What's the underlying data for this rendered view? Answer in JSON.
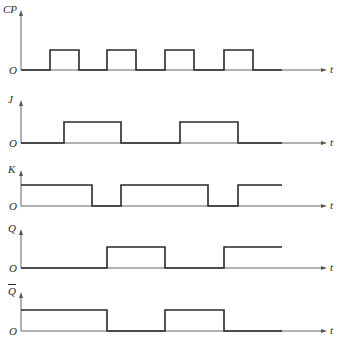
{
  "diagram": {
    "type": "timing-diagram",
    "time_axis_label": "t",
    "origin_label": "O",
    "colors": {
      "signal": "#2a2a2a",
      "axis": "#555555",
      "background": "#ffffff"
    },
    "edges_x": [
      21,
      50,
      64,
      79,
      92,
      107,
      121,
      136,
      165,
      180,
      194,
      208,
      224,
      238,
      253,
      282
    ],
    "signals": [
      {
        "name": "CP",
        "label": "CP",
        "base_y": 70,
        "high_y": 50,
        "label_y": 4,
        "levels": [
          [
            21,
            0
          ],
          [
            50,
            1
          ],
          [
            79,
            0
          ],
          [
            107,
            1
          ],
          [
            136,
            0
          ],
          [
            165,
            1
          ],
          [
            194,
            0
          ],
          [
            224,
            1
          ],
          [
            253,
            0
          ],
          [
            282,
            0
          ]
        ]
      },
      {
        "name": "J",
        "label": "J",
        "base_y": 143,
        "high_y": 122,
        "label_y": 94,
        "levels": [
          [
            21,
            0
          ],
          [
            64,
            1
          ],
          [
            121,
            0
          ],
          [
            180,
            1
          ],
          [
            238,
            0
          ],
          [
            282,
            0
          ]
        ]
      },
      {
        "name": "K",
        "label": "K",
        "base_y": 206,
        "high_y": 185,
        "label_y": 164,
        "levels": [
          [
            21,
            1
          ],
          [
            92,
            0
          ],
          [
            121,
            1
          ],
          [
            208,
            0
          ],
          [
            238,
            1
          ],
          [
            282,
            1
          ]
        ]
      },
      {
        "name": "Q",
        "label": "Q",
        "base_y": 268,
        "high_y": 247,
        "label_y": 223,
        "levels": [
          [
            21,
            0
          ],
          [
            107,
            1
          ],
          [
            165,
            0
          ],
          [
            224,
            1
          ],
          [
            282,
            1
          ]
        ]
      },
      {
        "name": "Qbar",
        "label": "Q",
        "overbar": true,
        "base_y": 331,
        "high_y": 310,
        "label_y": 286,
        "levels": [
          [
            21,
            1
          ],
          [
            107,
            0
          ],
          [
            165,
            1
          ],
          [
            224,
            0
          ],
          [
            282,
            0
          ]
        ]
      }
    ]
  }
}
